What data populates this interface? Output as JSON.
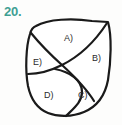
{
  "page": {
    "background_color": "#fdfdfc",
    "width": 122,
    "height": 125
  },
  "question": {
    "number_label": "20.",
    "number_color": "#3f9f93"
  },
  "figure": {
    "name": "subdivided-closed-curve-figure",
    "description_not_rendered": "",
    "stroke_color": "#1a1a1a",
    "fill_color": "#ffffff",
    "region_count": 5,
    "regions": [
      {
        "id": "A",
        "label": "A)"
      },
      {
        "id": "B",
        "label": "B)"
      },
      {
        "id": "C",
        "label": "C)"
      },
      {
        "id": "D",
        "label": "D)"
      },
      {
        "id": "E",
        "label": "E)"
      }
    ]
  }
}
